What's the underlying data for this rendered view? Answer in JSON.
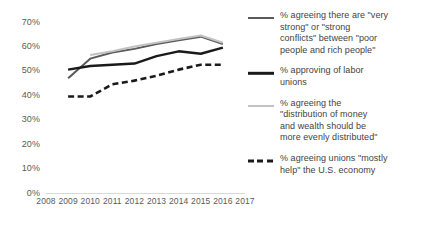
{
  "chart_data": {
    "type": "line",
    "title": "",
    "xlabel": "",
    "ylabel": "",
    "ylim": [
      0,
      70
    ],
    "grid": false,
    "legend_position": "right",
    "x": [
      2008,
      2009,
      2010,
      2011,
      2012,
      2013,
      2014,
      2015,
      2016,
      2017
    ],
    "xtick_labels": [
      "2008",
      "2009",
      "2010",
      "2011",
      "2012",
      "2013",
      "2014",
      "2015",
      "2016",
      "2017"
    ],
    "ytick_labels": [
      "0%",
      "10%",
      "20%",
      "30%",
      "40%",
      "50%",
      "60%",
      "70%"
    ],
    "ytick_values": [
      0,
      10,
      20,
      30,
      40,
      50,
      60,
      70
    ],
    "series": [
      {
        "name": "% agreeing there are \"very strong\" or \"strong conflicts\" between \"poor people and rich people\"",
        "color": "#595959",
        "style": "solid",
        "width": 2.0,
        "x": [
          2009,
          2010,
          2011,
          2012,
          2013,
          2014,
          2015,
          2016
        ],
        "values": [
          47,
          55,
          57.5,
          59,
          61,
          62.5,
          64,
          61
        ]
      },
      {
        "name": "% approving of labor unions",
        "color": "#1a1a1a",
        "style": "solid",
        "width": 2.4,
        "x": [
          2009,
          2010,
          2011,
          2012,
          2013,
          2014,
          2015,
          2016
        ],
        "values": [
          50.5,
          52,
          52.5,
          53,
          56,
          58,
          57,
          59.5
        ]
      },
      {
        "name": "% agreeing the \"distribution of money and wealth should be more evenly distributed\"",
        "color": "#c2c2c2",
        "style": "solid",
        "width": 2.0,
        "x": [
          2010,
          2011,
          2012,
          2013,
          2014,
          2015,
          2016
        ],
        "values": [
          56.5,
          58,
          60,
          61.5,
          63,
          64.5,
          61.5
        ]
      },
      {
        "name": "% agreeing unions \"mostly help\" the U.S. economy",
        "color": "#1a1a1a",
        "style": "dashed",
        "width": 2.6,
        "x": [
          2009,
          2010,
          2011,
          2012,
          2013,
          2014,
          2015,
          2016
        ],
        "values": [
          39.5,
          39.5,
          44.5,
          46,
          48,
          50.5,
          52.5,
          52.5
        ]
      }
    ]
  },
  "legend": {
    "items": [
      {
        "label": "% agreeing there are \"very\nstrong\" or \"strong\nconflicts\" between \"poor\npeople and rich people\"",
        "swatch": "solid-gray-line",
        "color": "#595959",
        "style": "solid"
      },
      {
        "label": "% approving of labor\nunions",
        "swatch": "solid-black-line",
        "color": "#1a1a1a",
        "style": "solid"
      },
      {
        "label": "% agreeing the\n\"distribution of money\nand wealth should be\nmore evenly distributed\"",
        "swatch": "solid-lightgray-line",
        "color": "#c2c2c2",
        "style": "solid"
      },
      {
        "label": "% agreeing unions \"mostly\nhelp\" the U.S. economy",
        "swatch": "dashed-black-line",
        "color": "#1a1a1a",
        "style": "dashed"
      }
    ]
  },
  "axis": {
    "baseline_color": "#d9d9d9",
    "tick_color": "#5a5a5a"
  }
}
